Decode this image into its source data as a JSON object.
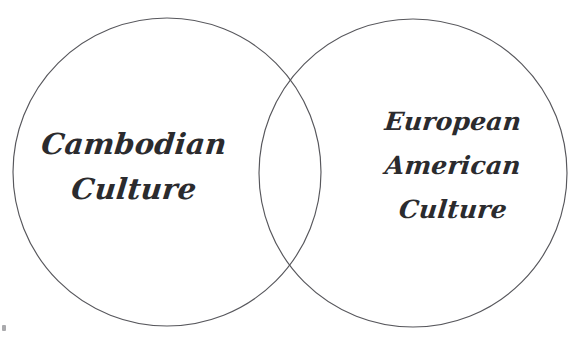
{
  "diagram": {
    "type": "venn",
    "title": "",
    "background_color": "#ffffff",
    "stroke_color": "#57575c",
    "text_color": "#2b2b2e",
    "sets": [
      {
        "id": "left",
        "name": "cambodian-culture",
        "label_lines": [
          "Cambodian",
          "Culture"
        ],
        "line1": "Cambodian",
        "line2": "Culture",
        "center_x": 167,
        "center_y": 172,
        "radius": 154
      },
      {
        "id": "right",
        "name": "european-american-culture",
        "label_lines": [
          "European",
          "American",
          "Culture"
        ],
        "line1": "European",
        "line2": "American",
        "line3": "Culture",
        "center_x": 413,
        "center_y": 173,
        "radius": 154
      }
    ],
    "intersection": {
      "label": "",
      "top_point_x": 292,
      "top_point_y": 74,
      "bottom_point_x": 290,
      "bottom_point_y": 280
    },
    "artifact": {
      "name": "stray-ink-mark",
      "x": 2,
      "y": 325
    }
  }
}
